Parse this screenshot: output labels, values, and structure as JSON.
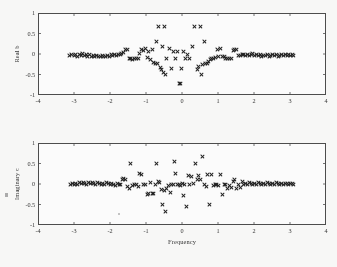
{
  "figure": {
    "background_color": "#fbfbfa",
    "frame_color": "#4a4a4a",
    "marker_color": "#1c1c1c",
    "marker_symbol": "x"
  },
  "chart_data": [
    {
      "type": "scatter",
      "title": "",
      "xlabel": "",
      "ylabel": "Real b",
      "xlim": [
        -4,
        4
      ],
      "ylim": [
        -1,
        1
      ],
      "xticks": [
        -4,
        -3,
        -2,
        -1,
        0,
        1,
        2,
        3,
        4
      ],
      "xtick_labels": [
        "-4",
        "-3",
        "-2",
        "-1",
        "0",
        "1",
        "2",
        "3",
        "4"
      ],
      "yticks": [
        -1,
        -0.5,
        0,
        0.5,
        1
      ],
      "ytick_labels": [
        "-1",
        "-0.5",
        "0",
        "0.5",
        "1"
      ],
      "grid": false,
      "legend": null,
      "points": [
        [
          -3.12,
          -0.03
        ],
        [
          -3.06,
          -0.02
        ],
        [
          -3.0,
          -0.04
        ],
        [
          -2.95,
          -0.01
        ],
        [
          -2.9,
          -0.05
        ],
        [
          -2.85,
          0.0
        ],
        [
          -2.8,
          -0.03
        ],
        [
          -2.76,
          0.02
        ],
        [
          -2.71,
          -0.04
        ],
        [
          -2.66,
          -0.01
        ],
        [
          -2.62,
          -0.05
        ],
        [
          -2.57,
          -0.02
        ],
        [
          -2.52,
          -0.06
        ],
        [
          -2.47,
          -0.03
        ],
        [
          -2.42,
          -0.05
        ],
        [
          -2.37,
          -0.04
        ],
        [
          -2.32,
          -0.06
        ],
        [
          -2.27,
          -0.05
        ],
        [
          -2.22,
          -0.04
        ],
        [
          -2.17,
          -0.06
        ],
        [
          -2.12,
          -0.05
        ],
        [
          -2.07,
          -0.03
        ],
        [
          -2.02,
          -0.05
        ],
        [
          -1.97,
          -0.02
        ],
        [
          -1.92,
          -0.04
        ],
        [
          -1.87,
          -0.01
        ],
        [
          -1.82,
          -0.03
        ],
        [
          -1.77,
          0.0
        ],
        [
          -1.72,
          -0.02
        ],
        [
          -1.67,
          0.01
        ],
        [
          -1.62,
          0.04
        ],
        [
          -1.57,
          0.11
        ],
        [
          -1.52,
          0.12
        ],
        [
          -1.47,
          -0.11
        ],
        [
          -1.42,
          -0.12
        ],
        [
          -1.37,
          -0.13
        ],
        [
          -1.32,
          -0.12
        ],
        [
          -1.27,
          -0.11
        ],
        [
          -1.22,
          -0.1
        ],
        [
          -1.17,
          0.02
        ],
        [
          -1.12,
          0.12
        ],
        [
          -1.07,
          0.09
        ],
        [
          -1.02,
          0.13
        ],
        [
          -0.97,
          -0.09
        ],
        [
          -0.92,
          0.06
        ],
        [
          -0.88,
          -0.14
        ],
        [
          -0.83,
          0.1
        ],
        [
          -0.78,
          -0.2
        ],
        [
          -0.73,
          -0.22
        ],
        [
          -0.7,
          0.3
        ],
        [
          -0.67,
          -0.24
        ],
        [
          -0.64,
          0.68
        ],
        [
          -0.6,
          -0.32
        ],
        [
          -0.57,
          -0.37
        ],
        [
          -0.54,
          0.19
        ],
        [
          -0.52,
          -0.46
        ],
        [
          -0.5,
          0.68
        ],
        [
          -0.47,
          -0.5
        ],
        [
          -0.42,
          -0.1
        ],
        [
          -0.36,
          0.13
        ],
        [
          -0.3,
          -0.35
        ],
        [
          -0.24,
          0.06
        ],
        [
          -0.18,
          -0.1
        ],
        [
          -0.13,
          0.05
        ],
        [
          -0.08,
          -0.72
        ],
        [
          -0.04,
          -0.72
        ],
        [
          -0.02,
          -0.35
        ],
        [
          0.04,
          0.05
        ],
        [
          0.1,
          -0.1
        ],
        [
          0.16,
          0.0
        ],
        [
          0.22,
          -0.1
        ],
        [
          0.28,
          0.19
        ],
        [
          0.36,
          0.68
        ],
        [
          0.42,
          -0.37
        ],
        [
          0.47,
          -0.31
        ],
        [
          0.5,
          0.68
        ],
        [
          0.54,
          -0.5
        ],
        [
          0.58,
          -0.26
        ],
        [
          0.62,
          0.3
        ],
        [
          0.66,
          -0.23
        ],
        [
          0.7,
          -0.22
        ],
        [
          0.74,
          -0.19
        ],
        [
          0.78,
          -0.14
        ],
        [
          0.83,
          -0.12
        ],
        [
          0.88,
          -0.1
        ],
        [
          0.93,
          -0.09
        ],
        [
          0.98,
          0.12
        ],
        [
          1.02,
          -0.07
        ],
        [
          1.07,
          0.13
        ],
        [
          1.12,
          -0.06
        ],
        [
          1.17,
          -0.06
        ],
        [
          1.22,
          -0.1
        ],
        [
          1.27,
          -0.11
        ],
        [
          1.32,
          -0.11
        ],
        [
          1.37,
          -0.1
        ],
        [
          1.42,
          0.09
        ],
        [
          1.47,
          0.12
        ],
        [
          1.52,
          0.1
        ],
        [
          1.57,
          -0.04
        ],
        [
          1.62,
          -0.03
        ],
        [
          1.67,
          -0.02
        ],
        [
          1.72,
          0.0
        ],
        [
          1.77,
          -0.03
        ],
        [
          1.82,
          -0.01
        ],
        [
          1.87,
          -0.04
        ],
        [
          1.92,
          -0.02
        ],
        [
          1.97,
          0.01
        ],
        [
          2.02,
          -0.03
        ],
        [
          2.07,
          0.0
        ],
        [
          2.12,
          -0.04
        ],
        [
          2.17,
          -0.02
        ],
        [
          2.22,
          -0.05
        ],
        [
          2.27,
          -0.03
        ],
        [
          2.32,
          -0.04
        ],
        [
          2.37,
          -0.02
        ],
        [
          2.42,
          -0.05
        ],
        [
          2.47,
          -0.03
        ],
        [
          2.52,
          -0.01
        ],
        [
          2.57,
          -0.04
        ],
        [
          2.62,
          -0.02
        ],
        [
          2.67,
          -0.05
        ],
        [
          2.72,
          -0.03
        ],
        [
          2.77,
          -0.02
        ],
        [
          2.82,
          -0.04
        ],
        [
          2.87,
          -0.02
        ],
        [
          2.92,
          -0.03
        ],
        [
          2.97,
          -0.02
        ],
        [
          3.02,
          -0.03
        ],
        [
          3.07,
          -0.02
        ],
        [
          3.11,
          -0.03
        ]
      ]
    },
    {
      "type": "scatter",
      "title": "",
      "xlabel": "Frequency",
      "ylabel": "Imaginary c",
      "xlim": [
        -4,
        4
      ],
      "ylim": [
        -1,
        1
      ],
      "xticks": [
        -4,
        -3,
        -2,
        -1,
        0,
        1,
        2,
        3,
        4
      ],
      "xtick_labels": [
        "-4",
        "-3",
        "-2",
        "-1",
        "0",
        "1",
        "2",
        "3",
        "4"
      ],
      "yticks": [
        -1,
        -0.5,
        0,
        0.5,
        1
      ],
      "ytick_labels": [
        "-1",
        "-0.5",
        "0",
        "0.5",
        "1"
      ],
      "grid": false,
      "legend": null,
      "points": [
        [
          -3.11,
          0.0
        ],
        [
          -3.05,
          0.01
        ],
        [
          -3.0,
          -0.01
        ],
        [
          -2.95,
          0.02
        ],
        [
          -2.9,
          0.0
        ],
        [
          -2.85,
          0.03
        ],
        [
          -2.8,
          0.01
        ],
        [
          -2.75,
          0.04
        ],
        [
          -2.7,
          0.02
        ],
        [
          -2.65,
          0.0
        ],
        [
          -2.6,
          0.03
        ],
        [
          -2.55,
          0.01
        ],
        [
          -2.5,
          0.04
        ],
        [
          -2.45,
          0.02
        ],
        [
          -2.4,
          0.0
        ],
        [
          -2.35,
          0.03
        ],
        [
          -2.3,
          0.01
        ],
        [
          -2.25,
          -0.01
        ],
        [
          -2.2,
          0.02
        ],
        [
          -2.15,
          0.0
        ],
        [
          -2.1,
          0.03
        ],
        [
          -2.05,
          0.01
        ],
        [
          -2.0,
          -0.02
        ],
        [
          -1.95,
          0.02
        ],
        [
          -1.9,
          0.0
        ],
        [
          -1.85,
          -0.03
        ],
        [
          -1.8,
          0.01
        ],
        [
          -1.75,
          -0.02
        ],
        [
          -1.7,
          0.0
        ],
        [
          -1.65,
          0.11
        ],
        [
          -1.62,
          0.13
        ],
        [
          -1.57,
          0.12
        ],
        [
          -1.52,
          -0.07
        ],
        [
          -1.47,
          -0.1
        ],
        [
          -1.42,
          0.5
        ],
        [
          -1.37,
          -0.04
        ],
        [
          -1.32,
          -0.02
        ],
        [
          -1.27,
          0.0
        ],
        [
          -1.22,
          -0.05
        ],
        [
          -1.17,
          0.25
        ],
        [
          -1.12,
          0.24
        ],
        [
          -1.07,
          -0.02
        ],
        [
          -1.02,
          0.0
        ],
        [
          -0.97,
          -0.25
        ],
        [
          -0.93,
          -0.22
        ],
        [
          -0.88,
          0.03
        ],
        [
          -0.83,
          -0.24
        ],
        [
          -0.78,
          -0.23
        ],
        [
          -0.73,
          -0.02
        ],
        [
          -0.7,
          0.5
        ],
        [
          -0.66,
          0.05
        ],
        [
          -0.62,
          0.03
        ],
        [
          -0.58,
          -0.13
        ],
        [
          -0.54,
          -0.5
        ],
        [
          -0.5,
          -0.17
        ],
        [
          -0.47,
          -0.68
        ],
        [
          -0.42,
          -0.1
        ],
        [
          -0.38,
          -0.03
        ],
        [
          -0.33,
          -0.2
        ],
        [
          -0.28,
          -0.02
        ],
        [
          -0.23,
          0.0
        ],
        [
          -0.2,
          0.55
        ],
        [
          -0.17,
          0.26
        ],
        [
          -0.13,
          -0.02
        ],
        [
          -0.08,
          0.0
        ],
        [
          -0.04,
          -0.03
        ],
        [
          0.0,
          0.02
        ],
        [
          0.04,
          -0.28
        ],
        [
          0.08,
          0.0
        ],
        [
          0.12,
          -0.55
        ],
        [
          0.17,
          0.2
        ],
        [
          0.22,
          0.0
        ],
        [
          0.27,
          0.18
        ],
        [
          0.32,
          0.02
        ],
        [
          0.38,
          0.49
        ],
        [
          0.42,
          0.1
        ],
        [
          0.47,
          0.2
        ],
        [
          0.52,
          0.12
        ],
        [
          0.57,
          0.67
        ],
        [
          0.62,
          0.0
        ],
        [
          0.67,
          -0.05
        ],
        [
          0.72,
          0.23
        ],
        [
          0.76,
          -0.51
        ],
        [
          0.82,
          0.24
        ],
        [
          0.87,
          -0.04
        ],
        [
          0.92,
          -0.02
        ],
        [
          0.97,
          0.0
        ],
        [
          1.02,
          -0.03
        ],
        [
          1.07,
          0.23
        ],
        [
          1.12,
          -0.25
        ],
        [
          1.17,
          -0.02
        ],
        [
          1.22,
          0.0
        ],
        [
          1.27,
          -0.1
        ],
        [
          1.32,
          -0.04
        ],
        [
          1.37,
          -0.09
        ],
        [
          1.42,
          0.05
        ],
        [
          1.47,
          0.1
        ],
        [
          1.52,
          -0.1
        ],
        [
          1.57,
          -0.02
        ],
        [
          1.62,
          -0.08
        ],
        [
          1.67,
          0.05
        ],
        [
          1.72,
          -0.01
        ],
        [
          1.77,
          0.02
        ],
        [
          1.82,
          0.0
        ],
        [
          1.87,
          0.03
        ],
        [
          1.92,
          0.01
        ],
        [
          1.97,
          -0.02
        ],
        [
          2.02,
          0.02
        ],
        [
          2.07,
          0.0
        ],
        [
          2.12,
          0.03
        ],
        [
          2.17,
          0.01
        ],
        [
          2.22,
          -0.01
        ],
        [
          2.27,
          0.02
        ],
        [
          2.32,
          0.0
        ],
        [
          2.37,
          0.03
        ],
        [
          2.42,
          0.01
        ],
        [
          2.47,
          -0.02
        ],
        [
          2.52,
          0.02
        ],
        [
          2.57,
          0.0
        ],
        [
          2.62,
          0.03
        ],
        [
          2.67,
          0.01
        ],
        [
          2.72,
          -0.01
        ],
        [
          2.77,
          0.02
        ],
        [
          2.82,
          0.0
        ],
        [
          2.87,
          0.02
        ],
        [
          2.92,
          0.01
        ],
        [
          2.97,
          0.0
        ],
        [
          3.02,
          0.02
        ],
        [
          3.07,
          0.01
        ],
        [
          3.11,
          0.0
        ]
      ]
    }
  ]
}
